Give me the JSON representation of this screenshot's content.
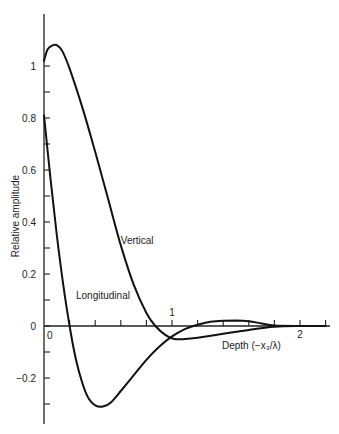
{
  "chart_data": {
    "type": "line",
    "title": "",
    "xlabel": "Depth (−x₃/λ)",
    "ylabel": "Relative amplitude",
    "xlim": [
      0,
      2.25
    ],
    "ylim": [
      -0.38,
      1.2
    ],
    "grid": false,
    "legend": "none (curves labeled inline)",
    "x_ticks": [
      0,
      0.2,
      0.4,
      0.6,
      0.8,
      1.0,
      1.2,
      1.4,
      1.6,
      1.8,
      2.0,
      2.2
    ],
    "x_tick_labels": [
      {
        "value": 0,
        "label": "0"
      },
      {
        "value": 1,
        "label": "1"
      },
      {
        "value": 2,
        "label": "2"
      }
    ],
    "y_ticks": [
      -0.3,
      -0.2,
      -0.1,
      0,
      0.1,
      0.2,
      0.3,
      0.4,
      0.5,
      0.6,
      0.7,
      0.8,
      0.9,
      1.0
    ],
    "y_tick_labels": [
      {
        "value": 1,
        "label": "1"
      },
      {
        "value": 0.8,
        "label": "0.8"
      },
      {
        "value": 0.6,
        "label": "0.6"
      },
      {
        "value": 0.4,
        "label": "0.4"
      },
      {
        "value": 0.2,
        "label": "0.2"
      },
      {
        "value": 0,
        "label": "0"
      },
      {
        "value": -0.2,
        "label": "−0.2"
      }
    ],
    "series": [
      {
        "name": "Vertical",
        "x": [
          0,
          0.03,
          0.07,
          0.1,
          0.14,
          0.2,
          0.3,
          0.4,
          0.5,
          0.6,
          0.7,
          0.8,
          0.87,
          0.95,
          1.02,
          1.1,
          1.2,
          1.4,
          1.6,
          1.8,
          2.0,
          2.2
        ],
        "y": [
          1.02,
          1.065,
          1.08,
          1.08,
          1.06,
          0.99,
          0.84,
          0.67,
          0.49,
          0.31,
          0.16,
          0.05,
          0.0,
          -0.035,
          -0.05,
          -0.05,
          -0.045,
          -0.03,
          -0.015,
          -0.003,
          0.0,
          0.0
        ]
      },
      {
        "name": "Longitudinal",
        "x": [
          0,
          0.05,
          0.1,
          0.15,
          0.2,
          0.25,
          0.3,
          0.35,
          0.4,
          0.46,
          0.52,
          0.6,
          0.7,
          0.8,
          0.9,
          1.0,
          1.1,
          1.2,
          1.3,
          1.4,
          1.5,
          1.6,
          1.7,
          1.8,
          2.0,
          2.2
        ],
        "y": [
          0.81,
          0.57,
          0.35,
          0.16,
          0.0,
          -0.13,
          -0.22,
          -0.28,
          -0.305,
          -0.31,
          -0.295,
          -0.25,
          -0.19,
          -0.13,
          -0.08,
          -0.04,
          -0.012,
          0.005,
          0.016,
          0.02,
          0.021,
          0.018,
          0.01,
          0.002,
          0.0,
          0.0
        ]
      }
    ],
    "annotations": [
      {
        "text": "Vertical",
        "x": 0.6,
        "y": 0.33
      },
      {
        "text": "Longitudinal",
        "x": 0.25,
        "y": 0.12
      }
    ]
  }
}
